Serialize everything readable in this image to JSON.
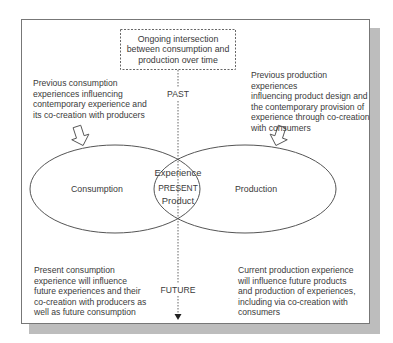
{
  "diagram": {
    "title_box": {
      "lines": [
        "Ongoing intersection",
        "between consumption and",
        "production over time"
      ]
    },
    "timeline": {
      "past_label": "PAST",
      "present_label": "PRESENT",
      "future_label": "FUTURE"
    },
    "ellipses": {
      "left_label": "Consumption",
      "right_label": "Production",
      "intersection_top": "Experience",
      "intersection_bottom": "Product"
    },
    "annotations": {
      "top_left": [
        "Previous consumption",
        "experiences influencing",
        "contemporary experience and",
        "its co-creation with producers"
      ],
      "top_right": [
        "Previous production experiences",
        "influencing product design and",
        "the contemporary provision of",
        "experience through co-creation",
        "with consumers"
      ],
      "bottom_left": [
        "Present consumption",
        "experience will influence",
        "future experiences and their",
        "co-creation with producers as",
        "well as future consumption"
      ],
      "bottom_right": [
        "Current production experience",
        "will influence future products",
        "and production of experiences,",
        "including via co-creation with",
        "consumers"
      ]
    },
    "colors": {
      "frame_border": "#777777",
      "shadow": "#bdbdbd",
      "line": "#555555",
      "text": "#3a3a3a"
    }
  }
}
